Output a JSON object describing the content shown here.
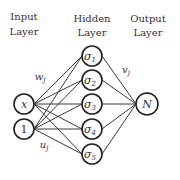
{
  "layers": {
    "input": {
      "line1": "Input",
      "line2": "Layer"
    },
    "hidden": {
      "line1": "Hidden",
      "line2": "Layer"
    },
    "output": {
      "line1": "Output",
      "line2": "Layer"
    }
  },
  "input_nodes": [
    {
      "label": "x",
      "italic": true
    },
    {
      "label": "1",
      "italic": false
    }
  ],
  "hidden_nodes": [
    {
      "symbol": "σ",
      "sub": "1"
    },
    {
      "symbol": "σ",
      "sub": "2"
    },
    {
      "symbol": "σ",
      "sub": "3"
    },
    {
      "symbol": "σ",
      "sub": "4"
    },
    {
      "symbol": "σ",
      "sub": "5"
    }
  ],
  "output_node": {
    "label": "N"
  },
  "weights": {
    "w": {
      "base": "w",
      "sub": "j"
    },
    "v": {
      "base": "v",
      "sub": "j"
    },
    "u": {
      "base": "u",
      "sub": "j"
    }
  },
  "colors": {
    "stroke": "#222222",
    "text": "#333333",
    "background": "#ffffff"
  }
}
